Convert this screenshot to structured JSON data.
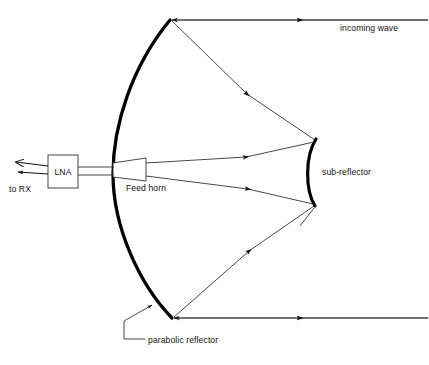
{
  "diagram": {
    "background_color": "#ffffff",
    "line_color": "#1a1a1a",
    "thick_line_color": "#000000",
    "text_color": "#111111",
    "labels": {
      "incoming_wave": "incoming wave",
      "sub_reflector": "sub-reflector",
      "parabolic_reflector": "parabolic reflector",
      "feed_horn": "Feed horn",
      "lna": "LNA",
      "to_rx": "to RX"
    },
    "components": [
      {
        "name": "parabolic-reflector",
        "label": "parabolic reflector",
        "shape": "thick-parabolic-arc"
      },
      {
        "name": "sub-reflector",
        "label": "sub-reflector",
        "shape": "thick-convex-arc"
      },
      {
        "name": "feed-horn",
        "label": "Feed horn",
        "shape": "trapezoid"
      },
      {
        "name": "lna",
        "label": "LNA",
        "shape": "rectangle"
      },
      {
        "name": "waveguide",
        "label": "",
        "shape": "double-line"
      },
      {
        "name": "output-arrows",
        "label": "to RX",
        "shape": "two-left-arrows"
      }
    ],
    "rays": [
      {
        "name": "incoming-wave-top",
        "direction": "leftward",
        "arrowheads": 2
      },
      {
        "name": "incoming-wave-bottom",
        "direction": "leftward",
        "arrowheads": 2
      },
      {
        "name": "dish-to-subreflector-top",
        "direction": "down-right",
        "arrowheads": 1
      },
      {
        "name": "dish-to-subreflector-bottom",
        "direction": "up-right",
        "arrowheads": 1
      },
      {
        "name": "subreflector-to-feed-top",
        "direction": "leftward",
        "arrowheads": 1
      },
      {
        "name": "subreflector-to-feed-bottom",
        "direction": "leftward",
        "arrowheads": 1
      }
    ]
  }
}
